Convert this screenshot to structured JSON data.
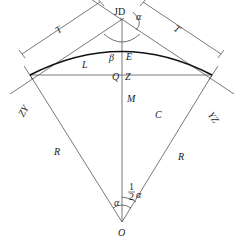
{
  "diagram": {
    "points": {
      "JD": "JD",
      "ZY": "ZY",
      "YZ": "YZ",
      "O": "O",
      "M": "M",
      "Q": "Q",
      "Z": "Z"
    },
    "segments": {
      "tangent_left": "T",
      "tangent_right": "T",
      "external": "E",
      "arc_length": "L",
      "chord": "C",
      "radius_left": "R",
      "radius_right": "R"
    },
    "angles": {
      "deflection": "α",
      "intersection": "β",
      "center": "α",
      "half_num": "1",
      "half_den": "2",
      "half_sym": "α"
    }
  }
}
